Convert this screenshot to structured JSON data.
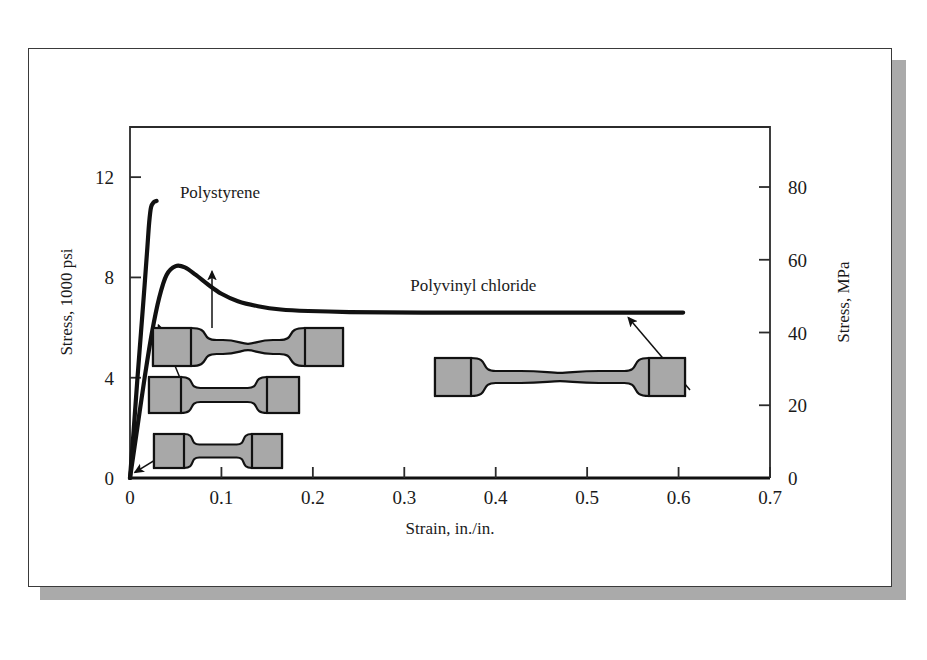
{
  "figure": {
    "card_background": "#ffffff",
    "shadow_color": "#aaaaaa",
    "border_color": "#3a3a3a"
  },
  "chart_data": {
    "type": "line",
    "title": "",
    "subtitle": "",
    "xlabel": "Strain, in./in.",
    "ylabel": "Stress, 1000 psi",
    "y2label": "Stress, MPa",
    "xlim": [
      0,
      0.7
    ],
    "ylim": [
      0,
      14
    ],
    "y2lim": [
      0,
      96.5
    ],
    "grid": false,
    "legend_position": "inline-annotations",
    "xticks": [
      "0",
      "0.1",
      "0.2",
      "0.3",
      "0.4",
      "0.5",
      "0.6",
      "0.7"
    ],
    "xtick_values": [
      0,
      0.1,
      0.2,
      0.3,
      0.4,
      0.5,
      0.6,
      0.7
    ],
    "yticks": [
      "0",
      "4",
      "8",
      "12"
    ],
    "ytick_values": [
      0,
      4,
      8,
      12
    ],
    "y2ticks": [
      "0",
      "20",
      "40",
      "60",
      "80"
    ],
    "y2tick_values": [
      0,
      20,
      40,
      60,
      80
    ],
    "series": [
      {
        "name": "Polystyrene",
        "label": "Polystyrene",
        "color": "#111111",
        "note": "brittle, fractures near 11 ksi at ~0.025 strain",
        "points": [
          [
            0.0,
            0.0
          ],
          [
            0.004,
            1.9
          ],
          [
            0.008,
            3.9
          ],
          [
            0.012,
            5.8
          ],
          [
            0.016,
            7.7
          ],
          [
            0.019,
            9.2
          ],
          [
            0.021,
            10.2
          ],
          [
            0.023,
            10.8
          ],
          [
            0.026,
            11.0
          ],
          [
            0.029,
            11.05
          ]
        ]
      },
      {
        "name": "Polyvinyl chloride",
        "label": "Polyvinyl chloride",
        "color": "#111111",
        "note": "ductile, yield peak ~8.4 ksi then cold-draw plateau ~6.6 ksi",
        "points": [
          [
            0.0,
            0.0
          ],
          [
            0.008,
            2.0
          ],
          [
            0.016,
            4.0
          ],
          [
            0.024,
            5.8
          ],
          [
            0.032,
            7.2
          ],
          [
            0.04,
            8.1
          ],
          [
            0.05,
            8.45
          ],
          [
            0.06,
            8.4
          ],
          [
            0.072,
            8.1
          ],
          [
            0.086,
            7.7
          ],
          [
            0.1,
            7.35
          ],
          [
            0.118,
            7.05
          ],
          [
            0.14,
            6.85
          ],
          [
            0.165,
            6.72
          ],
          [
            0.195,
            6.66
          ],
          [
            0.24,
            6.62
          ],
          [
            0.32,
            6.6
          ],
          [
            0.45,
            6.6
          ],
          [
            0.56,
            6.6
          ],
          [
            0.605,
            6.6
          ]
        ]
      }
    ],
    "annotations": [
      {
        "name": "polystyrene-label",
        "text": "Polystyrene",
        "x": 0.048,
        "y": 11.0
      },
      {
        "name": "polyvinyl-chloride-label",
        "text": "Polyvinyl chloride",
        "x": 0.3,
        "y": 7.3
      }
    ],
    "specimens": [
      {
        "name": "specimen-undeformed",
        "state": "undeformed",
        "points_to_strain": 0.002,
        "points_to_stress": 0.3
      },
      {
        "name": "specimen-elastic",
        "state": "elastically stretched",
        "points_to_strain": 0.03,
        "points_to_stress": 6.1
      },
      {
        "name": "specimen-necked",
        "state": "necked at yield point",
        "points_to_strain": 0.06,
        "points_to_stress": 8.4
      },
      {
        "name": "specimen-drawn",
        "state": "fully cold-drawn",
        "points_to_strain": 0.545,
        "points_to_stress": 6.6
      }
    ]
  }
}
